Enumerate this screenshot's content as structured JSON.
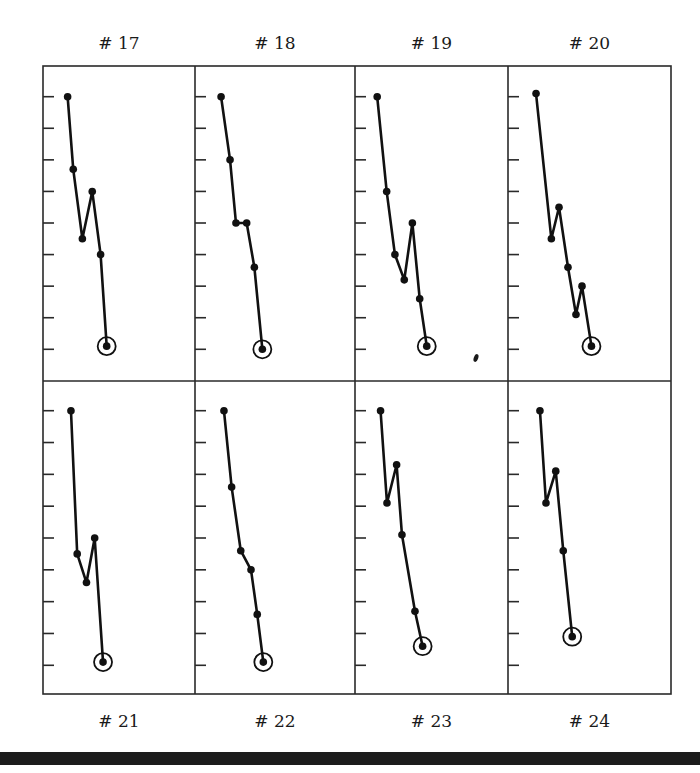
{
  "chart_data": {
    "type": "line",
    "title": "",
    "xlabel": "",
    "ylabel": "",
    "ylim": [
      0,
      8
    ],
    "xlim": [
      0,
      10
    ],
    "y_ticks": [
      0,
      1,
      2,
      3,
      4,
      5,
      6,
      7,
      8
    ],
    "y_tick_labels_shown": false,
    "grid": false,
    "legend": "none",
    "final_point_marker": "ringed",
    "panels": [
      {
        "label": "# 17",
        "label_position": "top",
        "x": [
          1.62,
          1.99,
          2.59,
          3.24,
          3.79,
          4.19
        ],
        "y": [
          8.0,
          5.7,
          3.5,
          5.0,
          3.0,
          0.1
        ]
      },
      {
        "label": "# 18",
        "label_position": "top",
        "x": [
          1.63,
          2.19,
          2.56,
          3.23,
          3.71,
          4.21
        ],
        "y": [
          8.0,
          6.0,
          4.0,
          4.0,
          2.6,
          0.0
        ]
      },
      {
        "label": "# 19",
        "label_position": "top",
        "x": [
          1.45,
          2.07,
          2.61,
          3.22,
          3.75,
          4.23,
          4.69
        ],
        "y": [
          8.0,
          5.0,
          3.0,
          2.2,
          4.0,
          1.6,
          0.1
        ]
      },
      {
        "label": "# 20",
        "label_position": "top",
        "x": [
          1.72,
          2.66,
          3.13,
          3.68,
          4.17,
          4.54,
          5.12
        ],
        "y": [
          8.1,
          3.5,
          4.5,
          2.6,
          1.1,
          2.0,
          0.1
        ]
      },
      {
        "label": "# 21",
        "label_position": "bottom",
        "x": [
          1.84,
          2.25,
          2.86,
          3.4,
          3.95
        ],
        "y": [
          8.0,
          3.5,
          2.6,
          4.0,
          0.1
        ]
      },
      {
        "label": "# 22",
        "label_position": "bottom",
        "x": [
          1.81,
          2.29,
          2.86,
          3.5,
          3.89,
          4.27
        ],
        "y": [
          8.0,
          5.6,
          3.6,
          3.0,
          1.6,
          0.1
        ]
      },
      {
        "label": "# 23",
        "label_position": "bottom",
        "x": [
          1.67,
          2.09,
          2.72,
          3.07,
          3.92,
          4.42
        ],
        "y": [
          8.0,
          5.1,
          6.3,
          4.1,
          1.7,
          0.6
        ]
      },
      {
        "label": "# 24",
        "label_position": "bottom",
        "x": [
          1.96,
          2.33,
          2.93,
          3.39,
          3.94
        ],
        "y": [
          8.0,
          5.1,
          6.1,
          3.6,
          0.9
        ]
      }
    ]
  },
  "colors": {
    "ink": "#111111",
    "frame": "#2a2a2a",
    "bar": "#1c1c1c",
    "background": "#ffffff"
  }
}
